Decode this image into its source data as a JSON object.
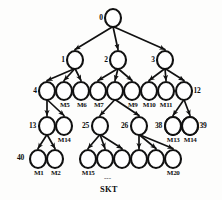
{
  "figure": {
    "caption": "SKT",
    "ellipsis": "---",
    "type": "tree-diagram"
  },
  "style": {
    "node_stroke": "#111111",
    "node_fill": "#ffffff",
    "background": "#fdfdfc",
    "edge_color": "#111111"
  },
  "levels": [
    {
      "level": 0,
      "y": 18,
      "nodes": [
        {
          "id": "n0",
          "label": "0",
          "x": 113,
          "label_side": "left"
        }
      ]
    },
    {
      "level": 1,
      "y": 60,
      "nodes": [
        {
          "id": "n1",
          "label": "1",
          "x": 75,
          "label_side": "left"
        },
        {
          "id": "n2",
          "label": "2",
          "x": 118,
          "label_side": "left"
        },
        {
          "id": "n3",
          "label": "3",
          "x": 165,
          "label_side": "left"
        }
      ]
    },
    {
      "level": 2,
      "y": 91,
      "nodes": [
        {
          "id": "n4",
          "label": "4",
          "x": 47,
          "label_side": "left"
        },
        {
          "id": "m5",
          "label": "M5",
          "x": 64,
          "label_side": "below"
        },
        {
          "id": "m6",
          "label": "M6",
          "x": 81,
          "label_side": "below"
        },
        {
          "id": "m7",
          "label": "M7",
          "x": 98,
          "label_side": "below"
        },
        {
          "id": "m8",
          "label": "M8",
          "x": 115,
          "label_side": "below-hidden"
        },
        {
          "id": "m9",
          "label": "M9",
          "x": 132,
          "label_side": "below"
        },
        {
          "id": "m10",
          "label": "M10",
          "x": 149,
          "label_side": "below"
        },
        {
          "id": "m11",
          "label": "M11",
          "x": 166,
          "label_side": "below"
        },
        {
          "id": "n12",
          "label": "12",
          "x": 184,
          "label_side": "right"
        }
      ]
    },
    {
      "level": 3,
      "y": 126,
      "nodes": [
        {
          "id": "n13",
          "label": "13",
          "x": 47,
          "label_side": "left"
        },
        {
          "id": "m14",
          "label": "M14",
          "x": 64,
          "label_side": "below"
        },
        {
          "id": "n25",
          "label": "25",
          "x": 100,
          "label_side": "left"
        },
        {
          "id": "n26",
          "label": "26",
          "x": 139,
          "label_side": "left"
        },
        {
          "id": "n38",
          "label": "38",
          "x": 173,
          "label_side": "left"
        },
        {
          "id": "n39",
          "label": "39",
          "x": 190,
          "label_side": "right"
        }
      ]
    },
    {
      "level": 4,
      "y": 159,
      "nodes": [
        {
          "id": "m1",
          "label": "M1",
          "x": 38,
          "label_side": "below",
          "corner_label": "40"
        },
        {
          "id": "m2",
          "label": "M2",
          "x": 55,
          "label_side": "below"
        },
        {
          "id": "m15",
          "label": "M15",
          "x": 88,
          "label_side": "below"
        },
        {
          "id": "m16",
          "label": "M16",
          "x": 105,
          "label_side": "below-hidden"
        },
        {
          "id": "m17",
          "label": "M17",
          "x": 122,
          "label_side": "below-hidden"
        },
        {
          "id": "m18",
          "label": "M18",
          "x": 139,
          "label_side": "below-hidden"
        },
        {
          "id": "m19",
          "label": "M19",
          "x": 156,
          "label_side": "below-hidden"
        },
        {
          "id": "m20",
          "label": "M20",
          "x": 173,
          "label_side": "below"
        }
      ]
    }
  ],
  "level3_extra_nodes": [
    {
      "id": "m13",
      "label": "M13",
      "x": 173
    },
    {
      "id": "m14b",
      "label": "M14",
      "x": 190
    }
  ],
  "visible_labels": {
    "root": "0",
    "branch1": "1",
    "branch2": "2",
    "branch3": "3",
    "node4": "4",
    "node12": "12",
    "node13": "13",
    "node25": "25",
    "node26": "26",
    "node38": "38",
    "node39": "39",
    "node40": "40",
    "m1": "M1",
    "m2": "M2",
    "m5": "M5",
    "m6": "M6",
    "m7": "M7",
    "m9": "M9",
    "m10": "M10",
    "m11": "M11",
    "m13": "M13",
    "m14": "M14",
    "m14b": "M14",
    "m15": "M15",
    "m20": "M20"
  },
  "edges": [
    {
      "from": "n0",
      "to": "n1"
    },
    {
      "from": "n0",
      "to": "n2"
    },
    {
      "from": "n0",
      "to": "n3"
    },
    {
      "from": "n1",
      "to": "n4"
    },
    {
      "from": "n1",
      "to": "m5"
    },
    {
      "from": "n1",
      "to": "m6"
    },
    {
      "from": "n2",
      "to": "m7"
    },
    {
      "from": "n2",
      "to": "m8"
    },
    {
      "from": "n2",
      "to": "m9"
    },
    {
      "from": "n3",
      "to": "m10"
    },
    {
      "from": "n3",
      "to": "m11"
    },
    {
      "from": "n3",
      "to": "n12"
    },
    {
      "from": "n4",
      "to": "n13"
    },
    {
      "from": "n4",
      "to": "m14"
    },
    {
      "from": "m8",
      "to": "n25"
    },
    {
      "from": "m8",
      "to": "n26"
    },
    {
      "from": "n12",
      "to": "n38"
    },
    {
      "from": "n12",
      "to": "n39"
    },
    {
      "from": "n13",
      "to": "m1"
    },
    {
      "from": "n13",
      "to": "m2"
    },
    {
      "from": "n25",
      "to": "m15"
    },
    {
      "from": "n25",
      "to": "m16"
    },
    {
      "from": "n25",
      "to": "m17"
    },
    {
      "from": "n26",
      "to": "m18"
    },
    {
      "from": "n26",
      "to": "m19"
    },
    {
      "from": "n26",
      "to": "m20"
    }
  ]
}
